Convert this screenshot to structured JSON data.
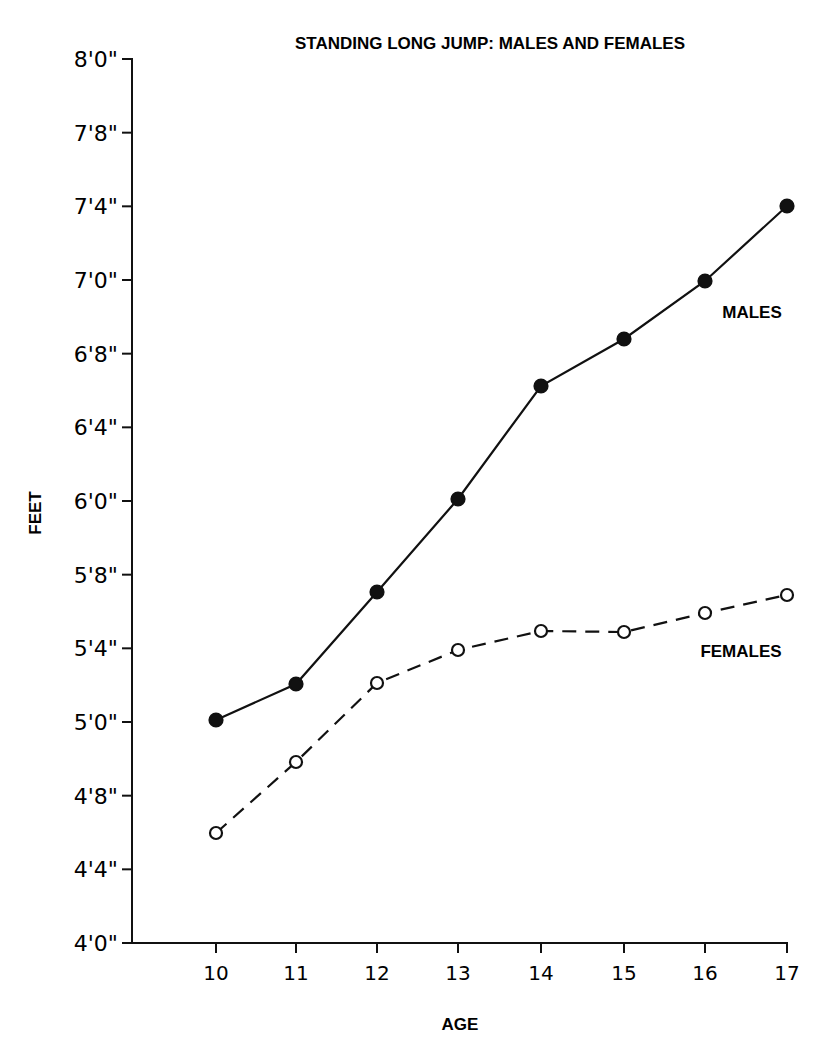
{
  "chart_data": {
    "type": "line",
    "title": "STANDING LONG JUMP: MALES AND FEMALES",
    "xlabel": "AGE",
    "ylabel": "FEET",
    "x": [
      10,
      11,
      12,
      13,
      14,
      15,
      16,
      17
    ],
    "x_tick_labels": [
      "10",
      "11",
      "12",
      "13",
      "14",
      "15",
      "16",
      "17"
    ],
    "y_tick_labels": [
      "4'0\"",
      "4'4\"",
      "4'8\"",
      "5'0\"",
      "5'4\"",
      "5'8\"",
      "6'0\"",
      "6'4\"",
      "6'8\"",
      "7'0\"",
      "7'4\"",
      "7'8\"",
      "8'0\""
    ],
    "y_units": "inches",
    "ylim_inches": [
      48,
      96
    ],
    "grid": false,
    "legend": "inline labels at right end of each series",
    "series": [
      {
        "name": "MALES",
        "style": "solid line, filled circle markers",
        "values_inches": [
          60,
          62,
          67,
          72,
          78,
          80.5,
          72.0,
          88
        ],
        "values_label": [
          "5'0\"",
          "5'2\"",
          "5'7\"",
          "6'0\"",
          "6'6\"",
          "6'8.5\"",
          "7'0\"",
          "7'4\""
        ]
      },
      {
        "name": "FEMALES",
        "style": "dashed line, open circle markers",
        "values_inches": [
          54,
          58,
          62,
          63.7,
          65,
          64.9,
          65.8,
          66.7
        ],
        "values_label": [
          "4'6\"",
          "4'10\"",
          "5'2\"",
          "5'4\"",
          "5'5\"",
          "5'5\"",
          "5'6\"",
          "5'7\""
        ]
      }
    ]
  },
  "labels": {
    "title": "STANDING LONG JUMP: MALES AND FEMALES",
    "xlabel": "AGE",
    "ylabel": "FEET",
    "males": "MALES",
    "females": "FEMALES"
  }
}
